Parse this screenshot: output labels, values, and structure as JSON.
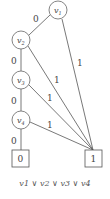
{
  "diagram": {
    "type": "binary-decision-diagram",
    "nodes": [
      {
        "id": "v1",
        "label": "v",
        "sub": "1"
      },
      {
        "id": "v2",
        "label": "v",
        "sub": "2"
      },
      {
        "id": "v3",
        "label": "v",
        "sub": "3"
      },
      {
        "id": "v4",
        "label": "v",
        "sub": "4"
      }
    ],
    "terminals": [
      {
        "id": "t0",
        "label": "0"
      },
      {
        "id": "t1",
        "label": "1"
      }
    ],
    "edges": [
      {
        "from": "v1",
        "to": "v2",
        "label": "0"
      },
      {
        "from": "v1",
        "to": "t1",
        "label": "1"
      },
      {
        "from": "v2",
        "to": "v3",
        "label": "0"
      },
      {
        "from": "v2",
        "to": "t1",
        "label": "1"
      },
      {
        "from": "v3",
        "to": "v4",
        "label": "0"
      },
      {
        "from": "v3",
        "to": "t1",
        "label": "1"
      },
      {
        "from": "v4",
        "to": "t0",
        "label": "0"
      },
      {
        "from": "v4",
        "to": "t1",
        "label": "1"
      }
    ],
    "caption": "v1 ∨ v2 ∨ v3 ∨ v4"
  }
}
